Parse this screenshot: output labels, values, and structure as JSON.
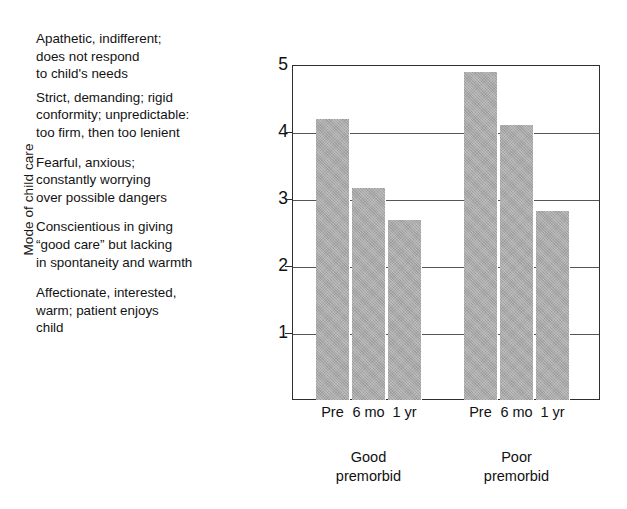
{
  "figure": {
    "y_axis_caption": "Mode of child care",
    "descriptors": [
      "Apathetic, indifferent;\ndoes not respond\nto child's needs",
      "Strict, demanding; rigid\nconformity; unpredictable:\ntoo firm, then too lenient",
      "Fearful, anxious;\nconstantly worrying\nover possible dangers",
      "Conscientious in giving\n“good care” but lacking\nin spontaneity and warmth",
      "Affectionate, interested,\nwarm; patient enjoys\nchild"
    ]
  },
  "chart_data": {
    "type": "bar",
    "title": "",
    "xlabel": "",
    "ylabel": "Mode of child care",
    "ylim": [
      0,
      5
    ],
    "yticks": [
      1,
      2,
      3,
      4,
      5
    ],
    "ytick_labels": [
      "1",
      "2",
      "3",
      "4",
      "5"
    ],
    "grid": true,
    "legend": "none",
    "categories": [
      "Pre",
      "6 mo",
      "1 yr"
    ],
    "groups": [
      "Good\npremorbid",
      "Poor\npremorbid"
    ],
    "group_labels_flat": [
      "Good premorbid",
      "Poor premorbid"
    ],
    "bar_color": "#a9a9a9",
    "series": [
      {
        "name": "Good premorbid",
        "categories": [
          "Pre",
          "6 mo",
          "1 yr"
        ],
        "values": [
          4.2,
          3.17,
          2.68
        ]
      },
      {
        "name": "Poor premorbid",
        "categories": [
          "Pre",
          "6 mo",
          "1 yr"
        ],
        "values": [
          4.9,
          4.1,
          2.82
        ]
      }
    ]
  }
}
